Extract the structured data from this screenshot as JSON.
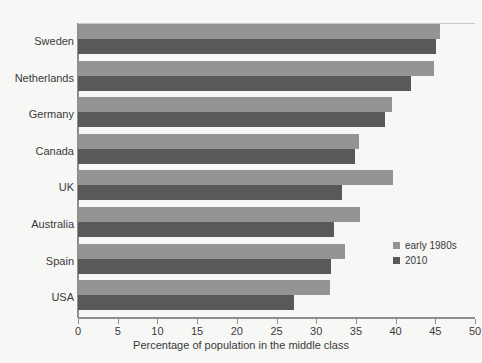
{
  "chart_data": {
    "type": "bar",
    "orientation": "horizontal",
    "title": "",
    "xlabel": "Percentage of population in the middle class",
    "ylabel": "",
    "xlim": [
      0,
      50
    ],
    "xticks": [
      0,
      5,
      10,
      15,
      20,
      25,
      30,
      35,
      40,
      45,
      50
    ],
    "xtick_labels": [
      "0",
      "5",
      "10",
      "15",
      "20",
      "25",
      "30",
      "35",
      "40",
      "45",
      "50"
    ],
    "grid": false,
    "legend_position": "center-right",
    "categories": [
      "Sweden",
      "Netherlands",
      "Germany",
      "Canada",
      "UK",
      "Australia",
      "Spain",
      "USA"
    ],
    "series": [
      {
        "name": "early 1980s",
        "color": "#949494",
        "values": [
          45.6,
          44.8,
          39.5,
          35.4,
          39.7,
          35.5,
          33.6,
          31.7
        ]
      },
      {
        "name": "2010",
        "color": "#595959",
        "values": [
          45.1,
          41.9,
          38.7,
          34.9,
          33.3,
          32.3,
          31.9,
          27.2
        ]
      }
    ]
  },
  "legend": {
    "items": [
      {
        "label": "early 1980s",
        "swatch": "early"
      },
      {
        "label": "2010",
        "swatch": "recent"
      }
    ]
  },
  "colors": {
    "background": "#f7f7f6",
    "axis": "#8d8d8d",
    "text": "#3a3a3a",
    "series_early": "#949494",
    "series_recent": "#595959"
  }
}
